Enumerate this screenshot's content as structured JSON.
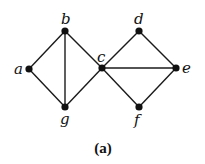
{
  "diagram": {
    "type": "graph",
    "caption": "(a)",
    "nodes": [
      {
        "id": "a",
        "label": "a",
        "x": 29,
        "y": 69,
        "lx": 14,
        "ly": 74
      },
      {
        "id": "b",
        "label": "b",
        "x": 65,
        "y": 31,
        "lx": 61,
        "ly": 24
      },
      {
        "id": "c",
        "label": "c",
        "x": 102,
        "y": 68,
        "lx": 97,
        "ly": 62
      },
      {
        "id": "d",
        "label": "d",
        "x": 139,
        "y": 31,
        "lx": 134,
        "ly": 24
      },
      {
        "id": "e",
        "label": "e",
        "x": 176,
        "y": 68,
        "lx": 182,
        "ly": 73
      },
      {
        "id": "f",
        "label": "f",
        "x": 139,
        "y": 107,
        "lx": 134,
        "ly": 125
      },
      {
        "id": "g",
        "label": "g",
        "x": 65,
        "y": 107,
        "lx": 60,
        "ly": 124
      }
    ],
    "edges": [
      [
        "a",
        "b"
      ],
      [
        "a",
        "g"
      ],
      [
        "b",
        "g"
      ],
      [
        "b",
        "c"
      ],
      [
        "g",
        "c"
      ],
      [
        "c",
        "d"
      ],
      [
        "c",
        "e"
      ],
      [
        "c",
        "f"
      ],
      [
        "d",
        "e"
      ],
      [
        "f",
        "e"
      ]
    ],
    "colors": {
      "edge": "#1a1a1a",
      "node": "#111111",
      "background": "#ffffff"
    }
  }
}
